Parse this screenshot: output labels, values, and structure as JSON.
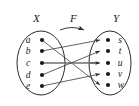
{
  "figure": {
    "domain_label": "X",
    "codomain_label": "Y",
    "map_label": "F",
    "domain_elements": [
      "a",
      "b",
      "c",
      "d",
      "e"
    ],
    "codomain_elements": [
      "s",
      "t",
      "u",
      "v",
      "w"
    ],
    "mapping": [
      {
        "from": "a",
        "to": "w"
      },
      {
        "from": "b",
        "to": "s"
      },
      {
        "from": "c",
        "to": "u"
      },
      {
        "from": "d",
        "to": "t"
      },
      {
        "from": "e",
        "to": "v"
      }
    ],
    "colors": {
      "ink": "#1a1a1a",
      "outline": "#2b2b2b",
      "edge": "#3a3a3a",
      "highlight_edge": "#6f6f6f",
      "background": "#ffffff"
    }
  }
}
